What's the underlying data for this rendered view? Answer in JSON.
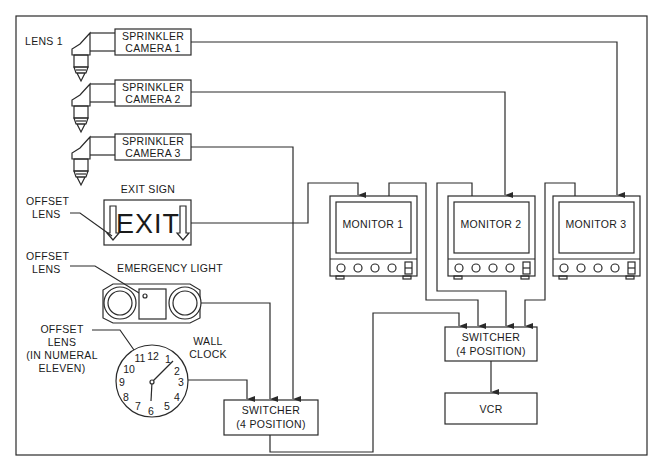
{
  "diagram": {
    "type": "hidden-camera surveillance wiring diagram",
    "cameras": [
      {
        "label_line1": "SPRINKLER",
        "label_line2": "CAMERA  1",
        "lens_label": "LENS  1"
      },
      {
        "label_line1": "SPRINKLER",
        "label_line2": "CAMERA  2"
      },
      {
        "label_line1": "SPRINKLER",
        "label_line2": "CAMERA  3"
      }
    ],
    "exit_sign": {
      "title": "EXIT  SIGN",
      "text": "EXIT",
      "lens_label_line1": "OFFSET",
      "lens_label_line2": "LENS"
    },
    "emergency_light": {
      "title": "EMERGENCY  LIGHT",
      "lens_label_line1": "OFFSET",
      "lens_label_line2": "LENS"
    },
    "wall_clock": {
      "title_line1": "WALL",
      "title_line2": "CLOCK",
      "lens_label_line1": "OFFSET",
      "lens_label_line2": "LENS",
      "lens_label_line3": "(IN  NUMERAL",
      "lens_label_line4": "ELEVEN)",
      "numerals": [
        "12",
        "1",
        "2",
        "3",
        "4",
        "5",
        "6",
        "7",
        "8",
        "9",
        "10",
        "11"
      ]
    },
    "monitors": [
      {
        "label": "MONITOR  1"
      },
      {
        "label": "MONITOR  2"
      },
      {
        "label": "MONITOR  3"
      }
    ],
    "switcher_left": {
      "line1": "SWITCHER",
      "line2": "(4  POSITION)"
    },
    "switcher_right": {
      "line1": "SWITCHER",
      "line2": "(4  POSITION)"
    },
    "vcr": {
      "label": "VCR"
    },
    "connections": [
      {
        "from": "SPRINKLER CAMERA 1",
        "to": "MONITOR 3"
      },
      {
        "from": "SPRINKLER CAMERA 2",
        "to": "MONITOR 2"
      },
      {
        "from": "SPRINKLER CAMERA 3",
        "to": "SWITCHER (left)"
      },
      {
        "from": "EXIT SIGN",
        "to": "MONITOR 1"
      },
      {
        "from": "EMERGENCY LIGHT",
        "to": "SWITCHER (left)"
      },
      {
        "from": "WALL CLOCK",
        "to": "SWITCHER (left)"
      },
      {
        "from": "SWITCHER (left)",
        "to": "SWITCHER (right)"
      },
      {
        "from": "MONITOR 1",
        "to": "SWITCHER (right)"
      },
      {
        "from": "MONITOR 2",
        "to": "SWITCHER (right)"
      },
      {
        "from": "MONITOR 3",
        "to": "SWITCHER (right)"
      },
      {
        "from": "SWITCHER (right)",
        "to": "VCR"
      }
    ]
  }
}
